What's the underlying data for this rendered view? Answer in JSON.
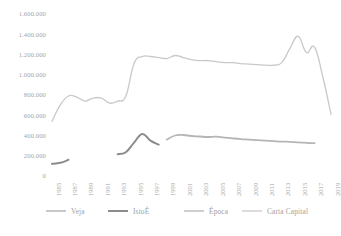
{
  "chart_data": {
    "type": "line",
    "title": "",
    "subtitle": "",
    "xlabel": "",
    "ylabel": "",
    "ylim": [
      0,
      1600000
    ],
    "xlim": [
      1985,
      2019
    ],
    "grid": false,
    "legend_position": "bottom",
    "yticks": [
      0,
      200000,
      400000,
      600000,
      800000,
      1000000,
      1200000,
      1400000,
      1600000
    ],
    "ytick_labels": [
      "0",
      "200.000",
      "400.000",
      "600.000",
      "800.000",
      "1.000.000",
      "1.200.000",
      "1.400.000",
      "1.600.000"
    ],
    "xticks": [
      1985,
      1987,
      1989,
      1991,
      1993,
      1995,
      1997,
      1999,
      2001,
      2003,
      2005,
      2007,
      2009,
      2011,
      2013,
      2015,
      2017,
      2019
    ],
    "xtick_labels": [
      "1985",
      "1987",
      "1989",
      "1991",
      "1993",
      "1995",
      "1997",
      "1999",
      "2001",
      "2003",
      "2005",
      "2007",
      "2009",
      "2011",
      "2013",
      "2015",
      "2017",
      "2019"
    ],
    "series": [
      {
        "name": "Veja",
        "color": "#c9c9c9",
        "width": 1.3,
        "x": [
          1985,
          1986,
          1987,
          1988,
          1989,
          1990,
          1991,
          1992,
          1993,
          1994,
          1995,
          1996,
          1997,
          1998,
          1999,
          2000,
          2001,
          2002,
          2003,
          2004,
          2005,
          2006,
          2007,
          2008,
          2009,
          2010,
          2011,
          2012,
          2013,
          2014,
          2015,
          2016,
          2017,
          2018,
          2019
        ],
        "values": [
          540000,
          700000,
          790000,
          780000,
          740000,
          770000,
          770000,
          720000,
          740000,
          790000,
          1110000,
          1180000,
          1180000,
          1170000,
          1160000,
          1190000,
          1170000,
          1150000,
          1140000,
          1140000,
          1130000,
          1120000,
          1120000,
          1110000,
          1105000,
          1100000,
          1095000,
          1095000,
          1120000,
          1260000,
          1380000,
          1220000,
          1270000,
          980000,
          610000
        ]
      },
      {
        "name": "IstoÉ",
        "color": "#8c8c8c",
        "width": 2.0,
        "x": [
          1985,
          1986,
          1987,
          1993,
          1994,
          1995,
          1996,
          1997,
          1998
        ],
        "values": [
          120000,
          130000,
          160000,
          215000,
          235000,
          330000,
          415000,
          350000,
          310000
        ],
        "segments": [
          [
            1985,
            1987
          ],
          [
            1993,
            1998
          ]
        ]
      },
      {
        "name": "Época",
        "color": "#b5b5b5",
        "width": 1.8,
        "x": [
          1999,
          2000,
          2001,
          2002,
          2003,
          2004,
          2005,
          2006,
          2007,
          2008,
          2009,
          2010,
          2011,
          2012,
          2013,
          2014,
          2015,
          2016,
          2017
        ],
        "values": [
          360000,
          400000,
          405000,
          395000,
          390000,
          385000,
          388000,
          380000,
          372000,
          365000,
          360000,
          355000,
          350000,
          345000,
          340000,
          338000,
          332000,
          328000,
          325000
        ]
      },
      {
        "name": "Carta Capital",
        "color": "#d8d8d8",
        "width": 1.2,
        "x": [],
        "values": []
      }
    ]
  },
  "legend": {
    "items": [
      {
        "label": "Veja",
        "color": "#c9c9c9",
        "thickness": "1.4px"
      },
      {
        "label": "IstoÉ",
        "color": "#8c8c8c",
        "thickness": "2.6px"
      },
      {
        "label": "Época",
        "color": "#cfcfcf",
        "thickness": "1.4px"
      },
      {
        "label": "Carta Capital",
        "color": "#dcdcdc",
        "thickness": "1.2px"
      }
    ]
  }
}
